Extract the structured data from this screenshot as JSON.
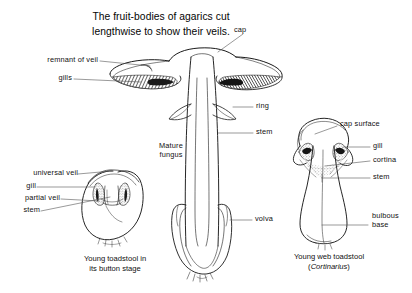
{
  "figure": {
    "title_line1": "The fruit-bodies of agarics cut",
    "title_line2": "lengthwise to show their veils.",
    "background_color": "#ffffff",
    "ink_color": "#111111"
  },
  "mature_fungus": {
    "name_label_line1": "Mature",
    "name_label_line2": "fungus",
    "labels": {
      "cap": "cap",
      "remnant_of_veil": "remnant of veil",
      "gills": "gills",
      "ring": "ring",
      "stem": "stem",
      "volva": "volva"
    }
  },
  "button_stage": {
    "labels": {
      "universal_veil": "universal veil",
      "gill": "gill",
      "partial_veil": "partial veil",
      "stem": "stem"
    },
    "caption_line1": "Young toadstool in",
    "caption_line2": "its button stage"
  },
  "web_toadstool": {
    "labels": {
      "cap_surface": "cap surface",
      "gill": "gill",
      "cortina": "cortina",
      "stem": "stem",
      "bulbous_base_line1": "bulbous",
      "bulbous_base_line2": "base"
    },
    "caption_line1": "Young web toadstool",
    "caption_genus": "Cortinarius",
    "caption_paren_open": "(",
    "caption_paren_close": ")"
  }
}
